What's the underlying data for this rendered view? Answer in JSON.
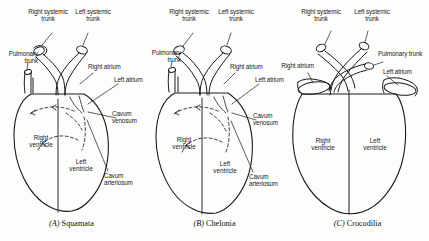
{
  "figure": {
    "background_color": "#fdfdfb",
    "line_color": "#1a1a1a",
    "panel_count": 3
  },
  "panels": [
    {
      "id": "A",
      "caption_letter": "(A)",
      "caption_name": "Squamata",
      "caption_full": "(A) Squamata",
      "labels": {
        "right_systemic_trunk": "Right systemic\ntrunk",
        "left_systemic_trunk": "Left systemic\ntrunk",
        "pulmonary_trunk": "Pulmonary\ntrunk",
        "right_atrium": "Right atrium",
        "left_atrium": "Left atrium",
        "cavum_venosum": "Cavum\nvenosum",
        "cavum_arteriosum": "Cavum\narteriosum",
        "right_ventricle": "Right\nventricle",
        "left_ventricle": "Left\nventricle"
      },
      "features": {
        "septum": "incomplete",
        "flow_arrows": "dashed",
        "atria_shape": "tubular"
      }
    },
    {
      "id": "B",
      "caption_letter": "(B)",
      "caption_name": "Chelonia",
      "caption_full": "(B) Chelonia",
      "labels": {
        "right_systemic_trunk": "Right systemic\ntrunk",
        "left_systemic_trunk": "Left systemic\ntrunk",
        "pulmonary_trunk": "Pulmonary\ntrunk",
        "right_atrium": "Right atrium",
        "left_atrium": "Left atrium",
        "cavum_venosum": "Cavum\nvenosum",
        "cavum_arteriosum": "Cavum\narteriosum",
        "right_ventricle": "Right\nventricle",
        "left_ventricle": "Left\nventricle"
      },
      "features": {
        "septum": "incomplete",
        "flow_arrows": "dashed",
        "atria_shape": "tubular"
      }
    },
    {
      "id": "C",
      "caption_letter": "(C)",
      "caption_name": "Crocodilia",
      "caption_full": "(C) Crocodilia",
      "labels": {
        "right_systemic_trunk": "Right systemic\ntrunk",
        "left_systemic_trunk": "Left systemic\ntrunk",
        "pulmonary_trunk": "Pulmonary trunk",
        "right_atrium": "Right atrium",
        "left_atrium": "Left atrium",
        "right_ventricle": "Right\nventricle",
        "left_ventricle": "Left\nventricle"
      },
      "features": {
        "septum": "complete",
        "flow_arrows": "none",
        "atria_shape": "funnel"
      }
    }
  ]
}
